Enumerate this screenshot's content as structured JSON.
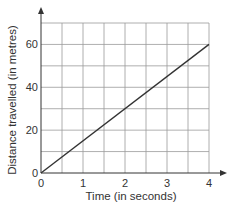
{
  "chart_data": {
    "type": "line",
    "title": "",
    "xlabel": "Time (in seconds)",
    "ylabel": "Distance travelled (in metres)",
    "xlim": [
      0,
      4
    ],
    "ylim": [
      0,
      70
    ],
    "x_ticks": [
      0,
      1,
      2,
      3,
      4
    ],
    "y_ticks": [
      0,
      20,
      40,
      60
    ],
    "x_grid_step": 0.5,
    "y_grid_step": 10,
    "grid": true,
    "legend": "none",
    "series": [
      {
        "name": "distance",
        "x": [
          0,
          4
        ],
        "y": [
          0,
          60
        ],
        "color": "#333333"
      }
    ]
  }
}
